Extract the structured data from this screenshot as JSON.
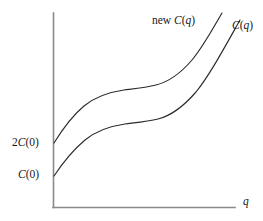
{
  "figure": {
    "name": "cost-function-shift-diagram",
    "background_color": "#ffffff",
    "line_color": "#2b2b2b",
    "axis_color": "#8a8a8a"
  },
  "labels": {
    "new_curve": "new C(q)",
    "old_curve": "C(q)",
    "y_tick_upper": "2C(0)",
    "y_tick_lower": "C(0)",
    "x_axis": "q"
  },
  "chart_data": {
    "type": "line",
    "title": "",
    "xlabel": "q",
    "ylabel": "",
    "xlim": [
      0,
      1
    ],
    "ylim": [
      0,
      1
    ],
    "grid": false,
    "legend_position": "inline-curve-labels",
    "axes": {
      "x_axis_visible": true,
      "y_axis_visible": true,
      "x_tick_labels": [
        "q"
      ],
      "y_tick_labels": [
        "C(0)",
        "2C(0)"
      ]
    },
    "annotations": [
      {
        "text": "new C(q)",
        "target": "upper-curve",
        "x": 0.56,
        "y": 0.94
      },
      {
        "text": "C(q)",
        "target": "lower-curve",
        "x": 0.99,
        "y": 0.91
      },
      {
        "text": "2C(0)",
        "target": "y-intercept-upper",
        "x": 0.0,
        "y": 0.35
      },
      {
        "text": "C(0)",
        "target": "y-intercept-lower",
        "x": 0.0,
        "y": 0.16
      }
    ],
    "series": [
      {
        "name": "new C(q)",
        "description": "Shifted cost curve; S-shaped, starts at 2C(0)",
        "y_intercept_label": "2C(0)",
        "x": [
          0.0,
          0.05,
          0.1,
          0.15,
          0.2,
          0.25,
          0.3,
          0.35,
          0.4,
          0.45,
          0.5,
          0.55,
          0.6,
          0.65,
          0.7,
          0.75,
          0.8,
          0.85,
          0.9,
          0.95
        ],
        "y": [
          0.35,
          0.43,
          0.5,
          0.55,
          0.59,
          0.62,
          0.645,
          0.662,
          0.673,
          0.68,
          0.686,
          0.694,
          0.708,
          0.73,
          0.762,
          0.806,
          0.862,
          0.925,
          0.985,
          1.04
        ]
      },
      {
        "name": "C(q)",
        "description": "Original cost curve; S-shaped, starts at C(0)",
        "y_intercept_label": "C(0)",
        "x": [
          0.0,
          0.05,
          0.1,
          0.15,
          0.2,
          0.25,
          0.3,
          0.35,
          0.4,
          0.45,
          0.5,
          0.55,
          0.6,
          0.65,
          0.7,
          0.75,
          0.8,
          0.85,
          0.9,
          0.95,
          1.0
        ],
        "y": [
          0.16,
          0.23,
          0.295,
          0.35,
          0.394,
          0.428,
          0.452,
          0.47,
          0.482,
          0.49,
          0.497,
          0.505,
          0.519,
          0.541,
          0.574,
          0.62,
          0.678,
          0.745,
          0.818,
          0.89,
          0.955
        ]
      }
    ]
  }
}
